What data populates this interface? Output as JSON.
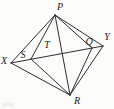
{
  "figure": {
    "background": "#fcfcfb",
    "line_color": "#2e2e2e",
    "label_color": "#1c1c1c",
    "width": 114,
    "height": 109,
    "points": {
      "P": {
        "label": "P",
        "x": 55,
        "y": 15,
        "label_x": 60,
        "label_y": 10
      },
      "X": {
        "label": "X",
        "x": 11,
        "y": 63,
        "label_x": 4,
        "label_y": 64
      },
      "Y": {
        "label": "Y",
        "x": 103,
        "y": 46,
        "label_x": 107,
        "label_y": 40
      },
      "R": {
        "label": "R",
        "x": 70,
        "y": 95,
        "label_x": 77,
        "label_y": 104
      },
      "S": {
        "label": "S",
        "x": 31,
        "y": 59,
        "label_x": 23,
        "label_y": 58
      },
      "T": {
        "label": "T",
        "x": 62,
        "y": 53,
        "label_x": 47,
        "label_y": 48
      },
      "Q": {
        "label": "Q",
        "x": 92,
        "y": 48,
        "label_x": 89,
        "label_y": 45
      }
    },
    "segments": [
      [
        "X",
        "P"
      ],
      [
        "P",
        "Y"
      ],
      [
        "Y",
        "R"
      ],
      [
        "R",
        "X"
      ],
      [
        "X",
        "Y"
      ],
      [
        "P",
        "R"
      ],
      [
        "P",
        "S"
      ],
      [
        "S",
        "R"
      ],
      [
        "P",
        "Q"
      ],
      [
        "Q",
        "R"
      ]
    ]
  }
}
